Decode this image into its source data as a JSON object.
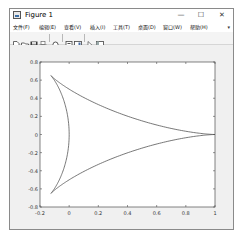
{
  "window": {
    "title": "Figure 1",
    "controls": {
      "minimize": "—",
      "maximize": "☐",
      "close": "✕"
    }
  },
  "menubar": {
    "items": [
      {
        "label": "文件(F)"
      },
      {
        "label": "编辑(E)"
      },
      {
        "label": "查看(V)"
      },
      {
        "label": "插入(I)"
      },
      {
        "label": "工具(T)"
      },
      {
        "label": "桌面(D)"
      },
      {
        "label": "窗口(W)"
      },
      {
        "label": "帮助(H)"
      }
    ],
    "overflow_arrow": "▾"
  },
  "toolbar": {
    "buttons": [
      {
        "icon": "new-figure-icon"
      },
      {
        "icon": "open-file-icon"
      },
      {
        "icon": "save-icon"
      },
      {
        "icon": "print-icon"
      },
      {
        "icon": "zoom-icon"
      },
      {
        "icon": "link-plot-icon"
      },
      {
        "icon": "insert-colorbar-icon"
      },
      {
        "icon": "edit-plot-icon"
      },
      {
        "icon": "property-inspector-icon"
      }
    ]
  },
  "chart_data": {
    "type": "line",
    "title": "",
    "xlabel": "",
    "ylabel": "",
    "xlim": [
      -0.2,
      1
    ],
    "ylim": [
      -0.8,
      0.8
    ],
    "xticks": [
      -0.2,
      0,
      0.2,
      0.4,
      0.6,
      0.8,
      1
    ],
    "yticks": [
      -0.8,
      -0.6,
      -0.4,
      -0.2,
      0,
      0.2,
      0.4,
      0.6,
      0.8
    ],
    "xtick_labels": [
      "-0.2",
      "0",
      "0.2",
      "0.4",
      "0.6",
      "0.8",
      "1"
    ],
    "ytick_labels": [
      "-0.8",
      "-0.6",
      "-0.4",
      "-0.2",
      "0",
      "0.2",
      "0.4",
      "0.6",
      "0.8"
    ],
    "grid": false,
    "legend": null,
    "line_color": "#555555",
    "series": [
      {
        "name": "curve",
        "x": [
          1.0,
          0.9853,
          0.9428,
          0.8762,
          0.7909,
          0.6928,
          0.5884,
          0.4837,
          0.3839,
          0.2932,
          0.2143,
          0.1488,
          0.0975,
          0.0595,
          0.0334,
          0.0171,
          0.0085,
          0.006,
          0.0087,
          0.0172,
          0.0338,
          0.0618,
          0.1047,
          0.1652,
          0.244,
          0.3404,
          0.4515,
          0.5722,
          0.6968,
          0.8191,
          0.9325,
          1.0,
          0.9325,
          0.8191,
          0.6968,
          0.5722,
          0.4515,
          0.3404,
          0.244,
          0.1652,
          0.1047,
          0.0618,
          0.0338,
          0.0172,
          0.0087,
          0.006,
          0.0085,
          0.0171,
          0.0334,
          0.0595,
          0.0975,
          0.1488,
          0.2143,
          0.2932,
          0.3839,
          0.4837,
          0.5884,
          0.6928,
          0.7909,
          0.8762,
          0.9428,
          0.9853,
          1.0
        ],
        "y": [
          0.0,
          0.0004,
          0.003,
          0.0097,
          0.0217,
          0.0394,
          0.0627,
          0.0908,
          0.1225,
          0.1565,
          0.1915,
          0.2263,
          0.2599,
          0.2918,
          0.3218,
          0.35,
          0.3768,
          0.4028,
          0.4288,
          0.4554,
          0.4834,
          0.5134,
          0.5457,
          0.58,
          0.6148,
          0.6468,
          0.6495,
          0.6148,
          0.5457,
          0.4554,
          0.35,
          0.0,
          -0.35,
          -0.4554,
          -0.5457,
          -0.6148,
          -0.6495,
          -0.6468,
          -0.6148,
          -0.58,
          -0.5457,
          -0.5134,
          -0.4834,
          -0.4554,
          -0.4288,
          -0.4028,
          -0.3768,
          -0.35,
          -0.3218,
          -0.2918,
          -0.2599,
          -0.2263,
          -0.1915,
          -0.1565,
          -0.1225,
          -0.0908,
          -0.0627,
          -0.0394,
          -0.0217,
          -0.0097,
          -0.003,
          -0.0004,
          0.0
        ],
        "parametric": "x = (2cos t + cos 2t + 1)/4, y = (2sin t - sin 2t)/4, t in [0, 2π]"
      }
    ]
  }
}
